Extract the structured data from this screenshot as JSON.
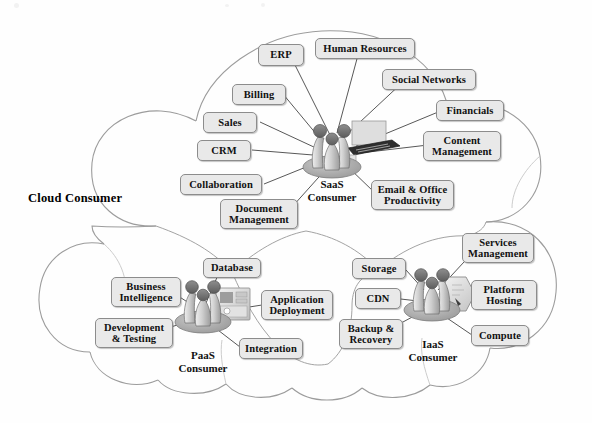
{
  "diagram": {
    "title": "Cloud Consumer",
    "type": "cloud-reference-architecture",
    "box_fill": "#e9e9e9",
    "box_border": "#8c8c8c",
    "connector_color": "#555555",
    "cloud_outline": "#9a9a9a",
    "background": "#fefefe"
  },
  "groups": [
    {
      "id": "saas",
      "hub_label": "SaaS\nConsumer",
      "hub_name": "saas-consumer-hub",
      "nodes": [
        {
          "label": "ERP",
          "name": "node-erp"
        },
        {
          "label": "Human Resources",
          "name": "node-human-resources"
        },
        {
          "label": "Social Networks",
          "name": "node-social-networks"
        },
        {
          "label": "Billing",
          "name": "node-billing"
        },
        {
          "label": "Financials",
          "name": "node-financials"
        },
        {
          "label": "Sales",
          "name": "node-sales"
        },
        {
          "label": "Content\nManagement",
          "name": "node-content-management"
        },
        {
          "label": "CRM",
          "name": "node-crm"
        },
        {
          "label": "Collaboration",
          "name": "node-collaboration"
        },
        {
          "label": "Email & Office\nProductivity",
          "name": "node-email-office-productivity"
        },
        {
          "label": "Document\nManagement",
          "name": "node-document-management"
        }
      ]
    },
    {
      "id": "paas",
      "hub_label": "PaaS\nConsumer",
      "hub_name": "paas-consumer-hub",
      "nodes": [
        {
          "label": "Database",
          "name": "node-database"
        },
        {
          "label": "Business\nIntelligence",
          "name": "node-business-intelligence"
        },
        {
          "label": "Application\nDeployment",
          "name": "node-application-deployment"
        },
        {
          "label": "Development\n& Testing",
          "name": "node-development-testing"
        },
        {
          "label": "Integration",
          "name": "node-integration"
        }
      ]
    },
    {
      "id": "iaas",
      "hub_label": "IaaS\nConsumer",
      "hub_name": "iaas-consumer-hub",
      "nodes": [
        {
          "label": "Services\nManagement",
          "name": "node-services-management"
        },
        {
          "label": "Storage",
          "name": "node-storage"
        },
        {
          "label": "Platform\nHosting",
          "name": "node-platform-hosting"
        },
        {
          "label": "CDN",
          "name": "node-cdn"
        },
        {
          "label": "Backup &\nRecovery",
          "name": "node-backup-recovery"
        },
        {
          "label": "Compute",
          "name": "node-compute"
        }
      ]
    }
  ]
}
